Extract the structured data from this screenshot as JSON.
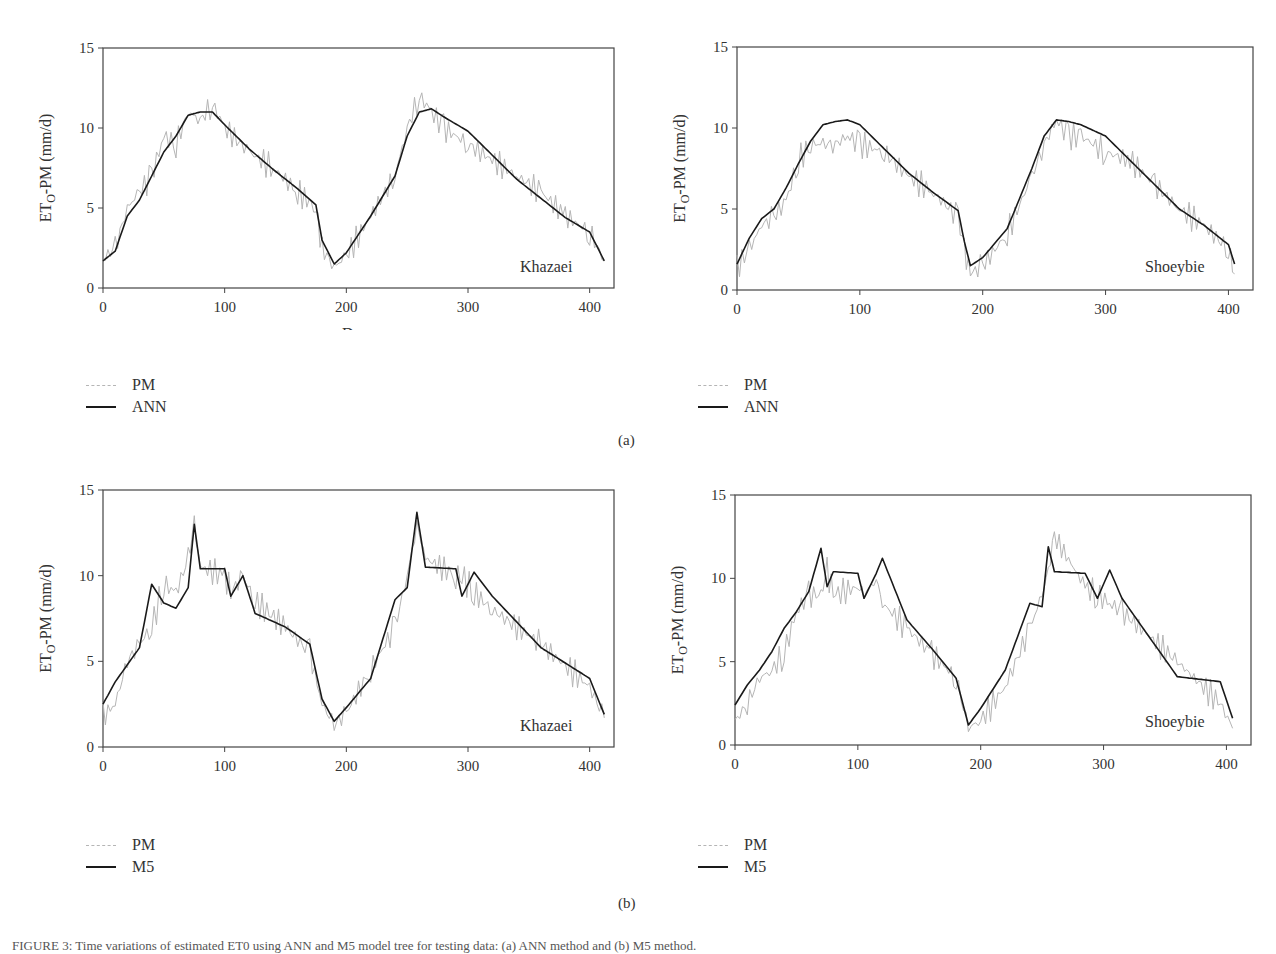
{
  "figure": {
    "subfigure_labels": [
      "(a)",
      "(b)"
    ],
    "caption": "FIGURE 3: Time variations of estimated ET0 using ANN and M5 model tree for testing data: (a) ANN method and (b) M5 method."
  },
  "panels": [
    {
      "id": "a-left",
      "station": "Khazaei",
      "xlabel": "Days",
      "ylabel": "ETO-PM (mm/d)",
      "legend": [
        "PM",
        "ANN"
      ]
    },
    {
      "id": "a-right",
      "station": "Shoeybie",
      "xlabel": "Days",
      "ylabel": "ETO-PM (mm/d)",
      "legend": [
        "PM",
        "ANN"
      ]
    },
    {
      "id": "b-left",
      "station": "Khazaei",
      "xlabel": "Days",
      "ylabel": "ETO-PM (mm/d)",
      "legend": [
        "PM",
        "M5"
      ]
    },
    {
      "id": "b-right",
      "station": "Shoeybie",
      "xlabel": "Days",
      "ylabel": "ETO-PM (mm/d)",
      "legend": [
        "PM",
        "M5"
      ]
    }
  ],
  "colors": {
    "pm": "#b5b5b5",
    "model": "#1a1a1a",
    "axis": "#444444"
  },
  "chart_data": [
    {
      "type": "line",
      "title": "Khazaei (a) ANN",
      "xlabel": "Days",
      "ylabel": "ETO-PM (mm/d)",
      "xlim": [
        0,
        420
      ],
      "ylim": [
        0,
        15
      ],
      "xticks": [
        0,
        100,
        200,
        300,
        400
      ],
      "yticks": [
        0,
        5,
        10,
        15
      ],
      "grid": false,
      "legend_position": "below-left",
      "x": [
        0,
        10,
        20,
        30,
        40,
        50,
        60,
        70,
        80,
        90,
        100,
        120,
        140,
        160,
        175,
        180,
        190,
        200,
        220,
        240,
        250,
        260,
        270,
        280,
        300,
        320,
        340,
        360,
        380,
        400,
        412
      ],
      "series": [
        {
          "name": "PM",
          "values": [
            1.8,
            2.5,
            5.0,
            6.0,
            7.0,
            9.5,
            9.0,
            11.0,
            10.5,
            11.5,
            10.0,
            8.5,
            7.5,
            6.0,
            5.0,
            2.5,
            1.3,
            2.0,
            4.5,
            7.0,
            10.0,
            12.0,
            11.0,
            10.0,
            9.0,
            8.0,
            7.0,
            6.0,
            4.5,
            3.5,
            1.7
          ]
        },
        {
          "name": "ANN",
          "values": [
            1.7,
            2.3,
            4.5,
            5.5,
            7.0,
            8.5,
            9.5,
            10.8,
            11.0,
            11.0,
            10.2,
            8.7,
            7.4,
            6.2,
            5.2,
            3.0,
            1.5,
            2.2,
            4.5,
            7.0,
            9.5,
            11.0,
            11.2,
            10.7,
            9.8,
            8.3,
            6.8,
            5.6,
            4.4,
            3.5,
            1.7
          ]
        }
      ]
    },
    {
      "type": "line",
      "title": "Shoeybie (a) ANN",
      "xlabel": "Days",
      "ylabel": "ETO-PM (mm/d)",
      "xlim": [
        0,
        420
      ],
      "ylim": [
        0,
        15
      ],
      "xticks": [
        0,
        100,
        200,
        300,
        400
      ],
      "yticks": [
        0,
        5,
        10,
        15
      ],
      "grid": false,
      "legend_position": "below-left",
      "x": [
        0,
        10,
        20,
        30,
        40,
        50,
        60,
        70,
        80,
        90,
        100,
        120,
        140,
        160,
        180,
        185,
        190,
        200,
        220,
        240,
        250,
        260,
        270,
        280,
        300,
        320,
        340,
        360,
        380,
        400,
        405
      ],
      "series": [
        {
          "name": "PM",
          "values": [
            1.4,
            2.5,
            4.0,
            4.5,
            5.5,
            8.0,
            9.0,
            9.0,
            9.0,
            9.5,
            9.0,
            8.5,
            7.0,
            6.0,
            4.5,
            2.5,
            1.0,
            1.5,
            3.5,
            7.0,
            9.0,
            10.5,
            9.5,
            9.5,
            8.5,
            8.0,
            6.5,
            5.0,
            4.0,
            2.5,
            1.0
          ]
        },
        {
          "name": "ANN",
          "values": [
            1.6,
            3.2,
            4.4,
            5.0,
            6.3,
            7.8,
            9.2,
            10.2,
            10.4,
            10.5,
            10.2,
            8.7,
            7.2,
            6.0,
            4.9,
            3.0,
            1.5,
            2.0,
            3.8,
            7.5,
            9.5,
            10.5,
            10.4,
            10.2,
            9.5,
            8.0,
            6.5,
            5.0,
            4.0,
            2.8,
            1.6
          ]
        }
      ]
    },
    {
      "type": "line",
      "title": "Khazaei (b) M5",
      "xlabel": "Days",
      "ylabel": "ETO-PM (mm/d)",
      "xlim": [
        0,
        420
      ],
      "ylim": [
        0,
        15
      ],
      "xticks": [
        0,
        100,
        200,
        300,
        400
      ],
      "yticks": [
        0,
        5,
        10,
        15
      ],
      "grid": false,
      "legend_position": "below-left",
      "x": [
        0,
        10,
        20,
        30,
        40,
        50,
        60,
        70,
        75,
        80,
        100,
        105,
        115,
        125,
        150,
        170,
        180,
        190,
        200,
        220,
        240,
        250,
        258,
        265,
        290,
        295,
        305,
        320,
        360,
        400,
        412
      ],
      "series": [
        {
          "name": "PM",
          "values": [
            1.8,
            2.5,
            5.0,
            6.0,
            7.0,
            9.5,
            9.0,
            11.0,
            13.0,
            10.5,
            10.0,
            9.0,
            10.0,
            8.5,
            7.0,
            5.5,
            2.5,
            1.3,
            2.0,
            4.5,
            7.0,
            10.0,
            13.0,
            11.0,
            10.0,
            10.0,
            9.0,
            8.0,
            6.0,
            3.5,
            1.7
          ]
        },
        {
          "name": "M5",
          "values": [
            2.5,
            3.8,
            4.8,
            5.8,
            9.5,
            8.4,
            8.1,
            9.3,
            13.0,
            10.4,
            10.4,
            8.8,
            10.0,
            7.8,
            7.0,
            6.0,
            2.8,
            1.5,
            2.3,
            4.0,
            8.6,
            9.3,
            13.7,
            10.5,
            10.4,
            8.8,
            10.2,
            8.8,
            5.8,
            4.0,
            1.9
          ]
        }
      ]
    },
    {
      "type": "line",
      "title": "Shoeybie (b) M5",
      "xlabel": "Days",
      "ylabel": "ETO-PM (mm/d)",
      "xlim": [
        0,
        420
      ],
      "ylim": [
        0,
        15
      ],
      "xticks": [
        0,
        100,
        200,
        300,
        400
      ],
      "yticks": [
        0,
        5,
        10,
        15
      ],
      "grid": false,
      "legend_position": "below-left",
      "x": [
        0,
        10,
        20,
        30,
        40,
        50,
        60,
        70,
        75,
        80,
        100,
        105,
        115,
        120,
        140,
        160,
        180,
        190,
        200,
        220,
        240,
        250,
        255,
        260,
        285,
        295,
        305,
        315,
        360,
        395,
        405
      ],
      "series": [
        {
          "name": "PM",
          "values": [
            1.4,
            2.5,
            4.0,
            4.5,
            5.5,
            8.0,
            9.0,
            9.0,
            10.5,
            9.0,
            9.5,
            9.0,
            10.0,
            8.5,
            7.0,
            5.5,
            4.0,
            1.0,
            1.5,
            3.5,
            7.0,
            9.0,
            10.5,
            12.5,
            9.5,
            9.0,
            8.5,
            8.0,
            5.0,
            2.5,
            1.0
          ]
        },
        {
          "name": "M5",
          "values": [
            2.4,
            3.6,
            4.5,
            5.6,
            7.0,
            8.0,
            9.2,
            11.8,
            9.5,
            10.4,
            10.3,
            8.8,
            10.3,
            11.2,
            7.5,
            5.8,
            4.0,
            1.2,
            2.2,
            4.5,
            8.5,
            8.3,
            11.9,
            10.4,
            10.3,
            8.8,
            10.5,
            8.8,
            4.1,
            3.8,
            1.6
          ]
        }
      ]
    }
  ]
}
